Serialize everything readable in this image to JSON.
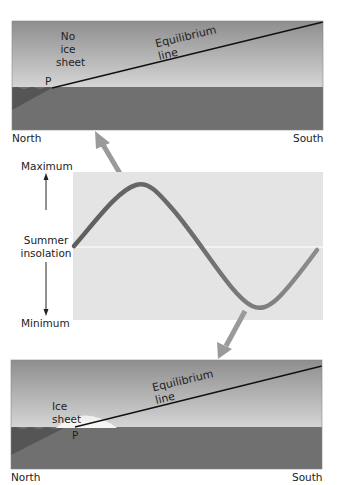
{
  "top_panel": {
    "state_label": "No\nice\nsheet",
    "state_lines": [
      "No",
      "ice",
      "sheet"
    ],
    "equilibrium_label": "Equilibrium line",
    "point_label": "P",
    "left_label": "North",
    "right_label": "South"
  },
  "middle_panel": {
    "axis_max_label": "Maximum",
    "axis_title_lines": [
      "Summer",
      "insolation"
    ],
    "axis_min_label": "Minimum",
    "curve": "summer-insolation-cycle"
  },
  "bottom_panel": {
    "state_label": "Ice sheet",
    "equilibrium_label": "Equilibrium line",
    "point_label": "P",
    "left_label": "North",
    "right_label": "South"
  },
  "colors": {
    "sky_top": "#8c8c8c",
    "sky_bottom": "#d2d2d2",
    "ground": "#6f6f6f",
    "ground_dark": "#555555",
    "plot_bg": "#e4e4e4",
    "curve": "#6b6b6b",
    "arrow": "#9a9a9a",
    "ice": "#f4f4f4"
  }
}
